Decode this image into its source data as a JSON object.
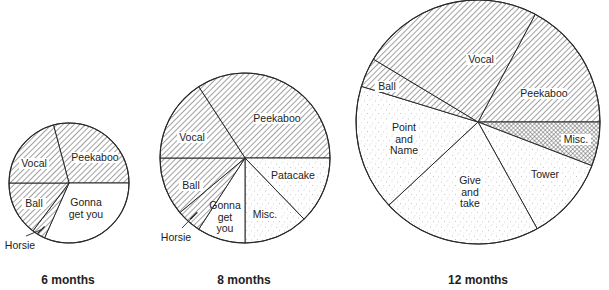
{
  "chart_data": [
    {
      "type": "pie",
      "title": "6 months",
      "center": [
        69,
        183
      ],
      "radius": 60,
      "slices": [
        {
          "label": "Peekaboo",
          "start": 255,
          "end": 360,
          "percent": 29,
          "fill": "hatch",
          "label_pos": [
            95,
            157
          ]
        },
        {
          "label": "Gonna get you",
          "lines": [
            "Gonna",
            "get you"
          ],
          "start": 0,
          "end": 114,
          "percent": 32,
          "fill": "white",
          "label_pos": [
            86,
            202
          ]
        },
        {
          "label": "Horsie",
          "start": 114,
          "end": 127,
          "percent": 4,
          "fill": "hatch",
          "label_pos": [
            20,
            245
          ],
          "callout": true
        },
        {
          "label": "Ball",
          "start": 127,
          "end": 180,
          "percent": 15,
          "fill": "hatch",
          "label_pos": [
            34,
            203
          ]
        },
        {
          "label": "Vocal",
          "start": 180,
          "end": 255,
          "percent": 21,
          "fill": "hatch",
          "label_pos": [
            34,
            163
          ]
        }
      ]
    },
    {
      "type": "pie",
      "title": "8 months",
      "center": [
        245,
        158
      ],
      "radius": 85,
      "slices": [
        {
          "label": "Peekaboo",
          "start": 237,
          "end": 360,
          "percent": 34,
          "fill": "hatch",
          "label_pos": [
            277,
            118
          ]
        },
        {
          "label": "Patacake",
          "start": 0,
          "end": 46,
          "percent": 13,
          "fill": "dots",
          "label_pos": [
            293,
            175
          ]
        },
        {
          "label": "Misc.",
          "start": 46,
          "end": 90,
          "percent": 12,
          "fill": "dots",
          "label_pos": [
            265,
            214
          ]
        },
        {
          "label": "Gonna get you",
          "lines": [
            "Gonna",
            "get",
            "you"
          ],
          "start": 90,
          "end": 123,
          "percent": 9,
          "fill": "white",
          "label_pos": [
            225,
            205
          ]
        },
        {
          "label": "Horsie",
          "start": 123,
          "end": 140,
          "percent": 5,
          "fill": "hatch",
          "label_pos": [
            176,
            237
          ],
          "callout": true
        },
        {
          "label": "Ball",
          "start": 140,
          "end": 180,
          "percent": 11,
          "fill": "hatch",
          "label_pos": [
            191,
            185
          ]
        },
        {
          "label": "Vocal",
          "start": 180,
          "end": 237,
          "percent": 16,
          "fill": "hatch",
          "label_pos": [
            192,
            137
          ]
        }
      ]
    },
    {
      "type": "pie",
      "title": "12 months",
      "center": [
        478,
        122
      ],
      "radius": 122,
      "slices": [
        {
          "label": "Peekaboo",
          "start": 298,
          "end": 360,
          "percent": 17,
          "fill": "hatch",
          "label_pos": [
            544,
            93
          ]
        },
        {
          "label": "Misc.",
          "start": 0,
          "end": 21,
          "percent": 6,
          "fill": "crosshatch",
          "label_pos": [
            576,
            139
          ]
        },
        {
          "label": "Tower",
          "start": 21,
          "end": 61,
          "percent": 11,
          "fill": "dots",
          "label_pos": [
            545,
            174
          ]
        },
        {
          "label": "Give and take",
          "lines": [
            "Give",
            "and",
            "take"
          ],
          "start": 61,
          "end": 137,
          "percent": 21,
          "fill": "dots",
          "label_pos": [
            470,
            180
          ]
        },
        {
          "label": "Point and Name",
          "lines": [
            "Point",
            "and",
            "Name"
          ],
          "start": 137,
          "end": 197,
          "percent": 17,
          "fill": "dots",
          "label_pos": [
            404,
            127
          ]
        },
        {
          "label": "Ball",
          "start": 197,
          "end": 211,
          "percent": 4,
          "fill": "hatch",
          "label_pos": [
            387,
            86
          ]
        },
        {
          "label": "Vocal",
          "start": 211,
          "end": 298,
          "percent": 24,
          "fill": "hatch",
          "label_pos": [
            481,
            59
          ]
        }
      ]
    }
  ],
  "captions": {
    "six": {
      "text": "6 months",
      "pos": [
        68,
        284
      ]
    },
    "eight": {
      "text": "8 months",
      "pos": [
        244,
        284
      ]
    },
    "twelve": {
      "text": "12 months",
      "pos": [
        478,
        284
      ]
    }
  },
  "colors": {
    "stroke": "#2a2a2a",
    "hatch": "#444444",
    "dots": "#8a8a8a",
    "background": "#ffffff"
  }
}
